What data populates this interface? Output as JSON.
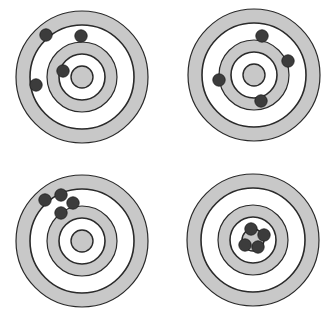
{
  "figure": {
    "colors": {
      "background": "#ffffff",
      "ring_gray": "#c8c8c8",
      "ring_white": "#ffffff",
      "ring_line": "#2a2a2a",
      "hole": "#3c3c3c",
      "hole_edge": "#1e1e1e"
    },
    "ring_radii": {
      "outer": 66,
      "outer_gray_inner": 52,
      "inner_gray_outer": 35,
      "inner_gray_inner": 23,
      "bullseye": 11
    },
    "hole_radius": 6.2,
    "targets": [
      {
        "name": "target-top-left",
        "label": "not accurate, not precise",
        "cx": 82,
        "cy": 77,
        "holes": [
          [
            46,
            35
          ],
          [
            81,
            36
          ],
          [
            63,
            71
          ],
          [
            36,
            85
          ]
        ]
      },
      {
        "name": "target-top-right",
        "label": "accurate, not precise",
        "cx": 254,
        "cy": 75,
        "holes": [
          [
            262,
            36
          ],
          [
            288,
            61
          ],
          [
            219,
            80
          ],
          [
            261,
            101
          ]
        ]
      },
      {
        "name": "target-bottom-left",
        "label": "precise, not accurate",
        "cx": 82,
        "cy": 241,
        "holes": [
          [
            45,
            200
          ],
          [
            61,
            195
          ],
          [
            73,
            203
          ],
          [
            61,
            213
          ]
        ]
      },
      {
        "name": "target-bottom-right",
        "label": "accurate and precise",
        "cx": 253,
        "cy": 240,
        "holes": [
          [
            251,
            229
          ],
          [
            264,
            235
          ],
          [
            245,
            245
          ],
          [
            258,
            247
          ]
        ]
      }
    ]
  }
}
